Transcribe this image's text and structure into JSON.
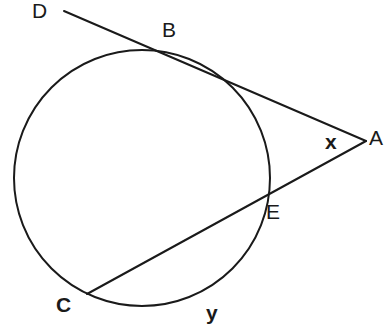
{
  "figure": {
    "kind": "circle-tangent-secant-angle-diagram",
    "background_color": "#ffffff",
    "stroke_color": "#1a1a1a",
    "width": 390,
    "height": 320
  },
  "labels": {
    "D": "D",
    "B": "B",
    "A": "A",
    "x": "x",
    "E": "E",
    "C": "C",
    "y": "y"
  },
  "geometry": {
    "circle": {
      "cx": 142,
      "cy": 178,
      "r": 128,
      "stroke_width": 2
    },
    "tangent_line": {
      "name": "line-D-B-A",
      "from": {
        "x": 64,
        "y": 11
      },
      "through": {
        "x": 165,
        "y": 54
      },
      "to": {
        "x": 366,
        "y": 141
      },
      "stroke_width": 2
    },
    "secant_line": {
      "name": "line-C-E-A",
      "from": {
        "x": 87,
        "y": 294
      },
      "through": {
        "x": 262,
        "y": 200
      },
      "to": {
        "x": 366,
        "y": 141
      },
      "stroke_width": 2
    },
    "points": {
      "A": {
        "x": 366,
        "y": 141
      },
      "B": {
        "x": 165,
        "y": 54
      },
      "C": {
        "x": 87,
        "y": 294
      },
      "D": {
        "x": 64,
        "y": 11
      },
      "E": {
        "x": 262,
        "y": 200
      }
    },
    "arcs": {
      "x_label_angle_at": "A",
      "y_label_arc": "minor-arc-C-to-E"
    }
  }
}
